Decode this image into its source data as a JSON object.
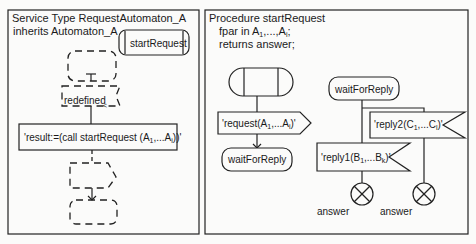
{
  "left_panel": {
    "title_line1": "Service Type RequestAutomaton_A",
    "title_line2": "inherits Automaton_A",
    "start_state": "startRequest",
    "redefined_label": "redefined",
    "task_text_prefix": "'result:=(call startRequest (A",
    "task_sub1": "1",
    "task_mid": ",...A",
    "task_sub2": "i",
    "task_suffix": "))'"
  },
  "right_panel": {
    "title_line1": "Procedure startRequest",
    "title_line2_prefix": "fpar in A",
    "title_line2_sub1": "1",
    "title_line2_mid": ",...,A",
    "title_line2_sub2": "i",
    "title_line2_suffix": ";",
    "title_line3": "returns answer;",
    "output_prefix": "'request(A",
    "output_sub1": "1",
    "output_mid": ",...A",
    "output_sub2": "i",
    "output_suffix": ")'",
    "state_left": "waitForReply",
    "state_right": "waitForReply",
    "reply2_prefix": "'reply2(C",
    "reply2_sub1": "1",
    "reply2_mid": ",...C",
    "reply2_sub2": "l",
    "reply2_suffix": ")'",
    "reply1_prefix": "'reply1(B",
    "reply1_sub1": "1",
    "reply1_mid": ",...B",
    "reply1_sub2": "k",
    "reply1_suffix": ")'",
    "return_label_1": "answer",
    "return_label_2": "answer"
  }
}
